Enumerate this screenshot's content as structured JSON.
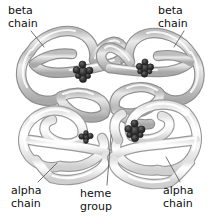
{
  "figure": {
    "background_color": "#ffffff",
    "width": 221,
    "height": 224
  },
  "labels": [
    {
      "id": "beta-chain-left",
      "text": "beta\nchain",
      "x": 8,
      "y": 5
    },
    {
      "id": "beta-chain-right",
      "text": "beta\nchain",
      "x": 158,
      "y": 5
    },
    {
      "id": "alpha-chain-left",
      "text": "alpha\nchain",
      "x": 11,
      "y": 185
    },
    {
      "id": "heme-group",
      "text": "heme\ngroup",
      "x": 80,
      "y": 188
    },
    {
      "id": "alpha-chain-right",
      "text": "alpha\nchain",
      "x": 163,
      "y": 185
    }
  ],
  "colors": {
    "text": "#101010",
    "leader_line": "#5a5a5a",
    "beta_chain_fill": "#d2d2d2",
    "beta_chain_stroke": "#8e8e8e",
    "alpha_chain_fill": "#f2f2f2",
    "alpha_chain_stroke": "#9a9a9a",
    "heme_group": "#2e2e2e",
    "highlight": "#ffffff"
  },
  "structure": {
    "subunit_count": 4,
    "heme_group_count": 4,
    "subunits": [
      {
        "name": "beta chain",
        "position": "upper-left",
        "shade": "dark"
      },
      {
        "name": "beta chain",
        "position": "upper-right",
        "shade": "dark"
      },
      {
        "name": "alpha chain",
        "position": "lower-left",
        "shade": "light"
      },
      {
        "name": "alpha chain",
        "position": "lower-right",
        "shade": "light"
      }
    ],
    "heme_groups": [
      {
        "id": "heme-upper-left",
        "cx": 83,
        "cy": 72
      },
      {
        "id": "heme-upper-right",
        "cx": 145,
        "cy": 68
      },
      {
        "id": "heme-lower-left",
        "cx": 86,
        "cy": 137
      },
      {
        "id": "heme-lower-right",
        "cx": 135,
        "cy": 131
      }
    ]
  },
  "leader_lines": [
    {
      "id": "leader-beta-left",
      "x1": 31,
      "y1": 31,
      "x2": 44,
      "y2": 47
    },
    {
      "id": "leader-beta-right",
      "x1": 184,
      "y1": 31,
      "x2": 174,
      "y2": 47
    },
    {
      "id": "leader-alpha-left",
      "x1": 38,
      "y1": 182,
      "x2": 57,
      "y2": 163
    },
    {
      "id": "leader-heme",
      "x1": 107,
      "y1": 185,
      "x2": 111,
      "y2": 135
    },
    {
      "id": "leader-alpha-right",
      "x1": 180,
      "y1": 182,
      "x2": 166,
      "y2": 157
    }
  ]
}
